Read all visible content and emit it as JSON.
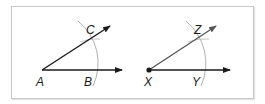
{
  "figure": {
    "left": {
      "vertex": {
        "label": "A",
        "x": 42,
        "y": 70
      },
      "ray_horizontal": {
        "label": "B",
        "tip": [
          122,
          70
        ],
        "label_pos": [
          84,
          85
        ]
      },
      "ray_angled": {
        "label": "C",
        "tip": [
          110,
          26
        ],
        "label_pos": [
          86,
          33
        ]
      },
      "arc_radius": 54,
      "vertex_dot": false
    },
    "right": {
      "vertex": {
        "label": "X",
        "x": 149,
        "y": 70
      },
      "ray_horizontal": {
        "label": "Y",
        "tip": [
          230,
          70
        ],
        "label_pos": [
          192,
          85
        ]
      },
      "ray_angled": {
        "label": "Z",
        "tip": [
          216,
          26
        ],
        "label_pos": [
          194,
          33
        ]
      },
      "arc_radius": 55,
      "vertex_dot": true
    }
  },
  "colors": {
    "ray": "#1a1a1a",
    "ray_copy": "#555555",
    "arc": "#a8a8a8",
    "frame": "#c8c8c8"
  }
}
